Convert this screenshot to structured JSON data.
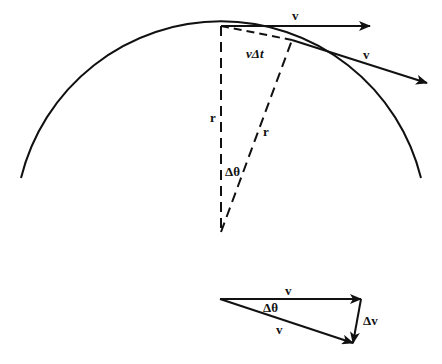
{
  "diagram": {
    "title": "",
    "colors": {
      "stroke": "#111111",
      "background": "#ffffff"
    },
    "circular_path": {
      "labels": {
        "velocity_top": "v",
        "velocity_tangent": "v",
        "arc_chord": "vΔt",
        "radius_vertical": "r",
        "radius_slanted": "r",
        "angle": "Δθ"
      }
    },
    "vector_triangle": {
      "labels": {
        "v_initial": "v",
        "v_final": "v",
        "angle": "Δθ",
        "delta_v": "Δv"
      }
    }
  }
}
